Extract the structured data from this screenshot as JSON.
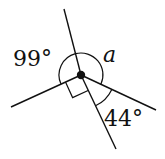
{
  "diagram": {
    "type": "angles-at-a-point",
    "labels": {
      "angle_99": "99°",
      "angle_a": "a",
      "angle_44": "44°"
    },
    "right_angle_marker": true,
    "center_dot": true,
    "rays": [
      "top",
      "left",
      "bottom",
      "right"
    ],
    "colors": {
      "stroke": "#111111",
      "background": "#ffffff"
    }
  }
}
